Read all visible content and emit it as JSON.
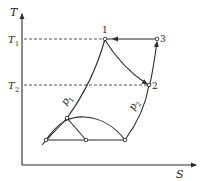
{
  "diagram": {
    "type": "T-S diagram",
    "axes": {
      "y_label": "T",
      "x_label": "S"
    },
    "levels": [
      {
        "name": "T1",
        "main": "T",
        "sub": "1"
      },
      {
        "name": "T2",
        "main": "T",
        "sub": "2"
      }
    ],
    "points": [
      {
        "label": "1"
      },
      {
        "label": "2"
      },
      {
        "label": "3"
      }
    ],
    "isobars": [
      {
        "main": "p",
        "sub": "1"
      },
      {
        "main": "p",
        "sub": "2"
      }
    ],
    "colors": {
      "line": "#2a2a2a",
      "dashed": "#444444",
      "background": "#ffffff"
    }
  }
}
